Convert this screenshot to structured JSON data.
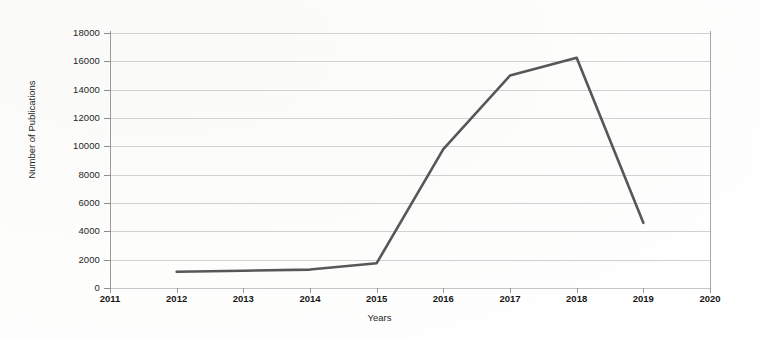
{
  "chart_data": {
    "type": "line",
    "title": "",
    "xlabel": "Years",
    "ylabel": "Number of Publications",
    "xlim": [
      2011,
      2020
    ],
    "ylim": [
      0,
      18000
    ],
    "grid": true,
    "legend": "none",
    "x_ticks": [
      "2011",
      "2012",
      "2013",
      "2014",
      "2015",
      "2016",
      "2017",
      "2018",
      "2019",
      "2020"
    ],
    "y_ticks": [
      "0",
      "2000",
      "4000",
      "6000",
      "8000",
      "10000",
      "12000",
      "14000",
      "16000",
      "18000"
    ],
    "line_color": "#575759",
    "series": [
      {
        "name": "Number of Publications",
        "x": [
          2012,
          2013,
          2014,
          2015,
          2016,
          2017,
          2018,
          2019
        ],
        "values": [
          1150,
          1220,
          1300,
          1750,
          9800,
          15000,
          16250,
          4600
        ]
      }
    ]
  }
}
